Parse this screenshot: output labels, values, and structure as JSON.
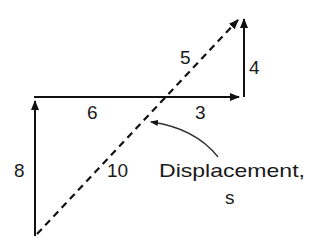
{
  "diagram": {
    "colors": {
      "stroke": "#111111",
      "text": "#1a1a1a",
      "background": "#ffffff"
    },
    "vectors": [
      {
        "id": "up-8",
        "label": "8",
        "style": "solid",
        "from": [
          35,
          236
        ],
        "to": [
          35,
          100
        ]
      },
      {
        "id": "right-9",
        "label_left": "6",
        "label_right": "3",
        "style": "solid",
        "from": [
          35,
          97
        ],
        "to": [
          240,
          97
        ]
      },
      {
        "id": "up-4",
        "label": "4",
        "style": "solid",
        "from": [
          243,
          97
        ],
        "to": [
          243,
          18
        ]
      },
      {
        "id": "displacement",
        "label_lower": "10",
        "label_upper": "5",
        "style": "dashed",
        "from": [
          37,
          234
        ],
        "to": [
          240,
          18
        ]
      }
    ],
    "labels": {
      "eight": "8",
      "six": "6",
      "three": "3",
      "four": "4",
      "five": "5",
      "ten": "10",
      "displacement_line1": "Displacement,",
      "displacement_line2": "s"
    }
  }
}
